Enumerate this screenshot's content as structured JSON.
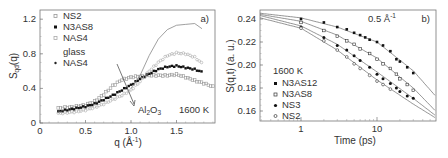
{
  "chart_data": [
    {
      "panel": "a)",
      "type": "scatter",
      "ylabel": "S_qd(q)",
      "xlabel": "q (Å⁻¹)",
      "xlim": [
        0,
        1.92
      ],
      "ylim": [
        0,
        1.3
      ],
      "xticks": [
        "0",
        "0.5",
        "1.0",
        "1.5"
      ],
      "yticks": [
        "0",
        "0.4",
        "0.8",
        "1.2"
      ],
      "grid": false,
      "legend": [
        "NS2",
        "N3AS8",
        "NAS4",
        "glass",
        "NAS4"
      ],
      "annotations": [
        "Al2O3",
        "1600 K",
        "a)"
      ],
      "series": [
        {
          "name": "NS2",
          "marker": "open-square",
          "x": [
            0.2,
            0.3,
            0.4,
            0.5,
            0.6,
            0.7,
            0.8,
            0.9,
            1.0,
            1.1,
            1.2,
            1.3,
            1.4,
            1.5,
            1.6,
            1.7,
            1.8,
            1.9
          ],
          "y": [
            0.17,
            0.18,
            0.19,
            0.21,
            0.25,
            0.33,
            0.43,
            0.5,
            0.53,
            0.54,
            0.55,
            0.55,
            0.55,
            0.56,
            0.53,
            0.49,
            0.46,
            0.42
          ]
        },
        {
          "name": "N3AS8",
          "marker": "filled-square",
          "x": [
            0.2,
            0.3,
            0.4,
            0.5,
            0.6,
            0.7,
            0.8,
            0.9,
            1.0,
            1.1,
            1.2,
            1.3,
            1.4,
            1.5,
            1.6,
            1.7,
            1.78
          ],
          "y": [
            0.13,
            0.15,
            0.17,
            0.19,
            0.22,
            0.27,
            0.32,
            0.38,
            0.44,
            0.51,
            0.57,
            0.62,
            0.65,
            0.66,
            0.64,
            0.62,
            0.59
          ]
        },
        {
          "name": "NAS4",
          "marker": "open-circle-grey",
          "x": [
            0.2,
            0.3,
            0.4,
            0.5,
            0.6,
            0.7,
            0.8,
            0.9,
            1.0,
            1.1,
            1.2,
            1.3,
            1.4,
            1.5,
            1.6,
            1.7,
            1.78
          ],
          "y": [
            0.11,
            0.12,
            0.13,
            0.15,
            0.18,
            0.22,
            0.27,
            0.32,
            0.38,
            0.48,
            0.6,
            0.7,
            0.78,
            0.81,
            0.8,
            0.76,
            0.69
          ]
        },
        {
          "name": "glass NAS4",
          "marker": "line",
          "x": [
            1.0,
            1.1,
            1.2,
            1.3,
            1.4,
            1.5,
            1.6,
            1.7,
            1.78
          ],
          "y": [
            0.4,
            0.55,
            0.78,
            0.97,
            1.08,
            1.13,
            1.14,
            1.15,
            1.09
          ]
        }
      ]
    },
    {
      "panel": "b)",
      "type": "scatter",
      "ylabel": "S(q,t) (a. u.)",
      "xlabel": "Time (ps)",
      "xscale": "log",
      "xlim": [
        0.29,
        59
      ],
      "ylim": [
        0.152,
        0.248
      ],
      "xticks": [
        "1",
        "10"
      ],
      "yticks": [
        "0.16",
        "0.18",
        "0.20",
        "0.22",
        "0.24"
      ],
      "grid": false,
      "legend_title": "1600 K",
      "legend": [
        "N3AS12",
        "N3AS8",
        "NS3",
        "NS2"
      ],
      "annotations": [
        "0.5 Å⁻¹",
        "b)"
      ],
      "series": [
        {
          "name": "N3AS12",
          "marker": "filled-square",
          "x": [
            1,
            2,
            3,
            4,
            5,
            6,
            7,
            8,
            10,
            12,
            15,
            18,
            20,
            25,
            30
          ],
          "y": [
            0.24,
            0.237,
            0.233,
            0.231,
            0.228,
            0.226,
            0.224,
            0.222,
            0.22,
            0.217,
            0.212,
            0.205,
            0.203,
            0.198,
            0.193
          ]
        },
        {
          "name": "N3AS8",
          "marker": "open-square",
          "x": [
            1,
            2,
            3,
            4,
            5,
            6,
            8,
            10,
            12,
            15,
            18,
            20,
            25,
            30
          ],
          "y": [
            0.237,
            0.23,
            0.225,
            0.221,
            0.218,
            0.214,
            0.21,
            0.205,
            0.201,
            0.197,
            0.192,
            0.188,
            0.183,
            0.178
          ]
        },
        {
          "name": "NS3",
          "marker": "filled-circle",
          "x": [
            1,
            2,
            3,
            4,
            5,
            6,
            8,
            10,
            12,
            15,
            18,
            20,
            25,
            30
          ],
          "y": [
            0.233,
            0.224,
            0.217,
            0.213,
            0.208,
            0.204,
            0.198,
            0.192,
            0.188,
            0.184,
            0.18,
            0.177,
            0.173,
            0.171
          ]
        },
        {
          "name": "NS2",
          "marker": "open-circle",
          "x": [
            1,
            2,
            3,
            4,
            5,
            6,
            8,
            10,
            12,
            15
          ],
          "y": [
            0.232,
            0.221,
            0.213,
            0.207,
            0.201,
            0.197,
            0.191,
            0.186,
            0.183,
            0.179
          ]
        }
      ],
      "fits": [
        {
          "name": "N3AS12 fit",
          "x": [
            0.29,
            1,
            3,
            10,
            30,
            59
          ],
          "y": [
            0.245,
            0.241,
            0.233,
            0.22,
            0.195,
            0.173
          ]
        },
        {
          "name": "N3AS8 fit",
          "x": [
            0.29,
            1,
            3,
            10,
            30,
            59
          ],
          "y": [
            0.244,
            0.238,
            0.226,
            0.206,
            0.18,
            0.16
          ]
        },
        {
          "name": "NS3 fit",
          "x": [
            0.29,
            1,
            3,
            10,
            30,
            59
          ],
          "y": [
            0.243,
            0.234,
            0.218,
            0.194,
            0.171,
            0.156
          ]
        },
        {
          "name": "NS2 fit",
          "x": [
            0.29,
            1,
            3,
            10,
            30,
            59
          ],
          "y": [
            0.241,
            0.232,
            0.213,
            0.187,
            0.166,
            0.154
          ]
        }
      ]
    }
  ],
  "panel_a": {
    "ylabel_main": "S",
    "ylabel_sub": "qd",
    "ylabel_tail": "(q)",
    "xlabel": "q  (Å",
    "xlabel_sup": "-1",
    "xlabel_tail": ")",
    "tag": "a)",
    "temp": "1600 K",
    "al_main": "Al",
    "al_sub1": "2",
    "al_o": "O",
    "al_sub2": "3",
    "ticks_x": [
      "0",
      "0.5",
      "1.0",
      "1.5"
    ],
    "ticks_y": [
      "0",
      "0.4",
      "0.8",
      "1.2"
    ],
    "legend": [
      "NS2",
      "N3AS8",
      "NAS4",
      "glass",
      "NAS4"
    ]
  },
  "panel_b": {
    "ylabel": "S(q,t)  (a. u.)",
    "xlabel": "Time  (ps)",
    "tag": "b)",
    "q_label": "0.5 Å",
    "q_sup": "-1",
    "ticks_x": [
      "1",
      "10"
    ],
    "ticks_y": [
      "0.24",
      "0.22",
      "0.20",
      "0.18",
      "0.16"
    ],
    "legend_title": "1600 K",
    "legend": [
      "N3AS12",
      "N3AS8",
      "NS3",
      "NS2"
    ]
  }
}
